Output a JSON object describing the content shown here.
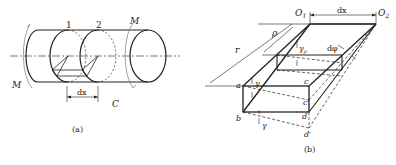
{
  "figure_a": {
    "caption": "(a)",
    "labels": {
      "section1": "1",
      "section2": "2",
      "moment_left": "M",
      "moment_right": "M",
      "dx": "dx",
      "c": "C"
    }
  },
  "figure_b": {
    "caption": "(b)",
    "labels": {
      "o1": "O",
      "o1_sub": "1",
      "o2": "O",
      "o2_sub": "2",
      "dx": "dx",
      "r": "r",
      "rho": "ρ",
      "gamma_rho": "γ",
      "gamma_rho_sub": "ρ",
      "dphi": "dφ",
      "a": "a",
      "b": "b",
      "c": "c",
      "c_prime": "c′",
      "d": "d",
      "d_prime": "d′",
      "gamma_top": "γ",
      "gamma_bottom": "γ"
    }
  },
  "colors": {
    "stroke": "#222222",
    "light": "#888888"
  }
}
